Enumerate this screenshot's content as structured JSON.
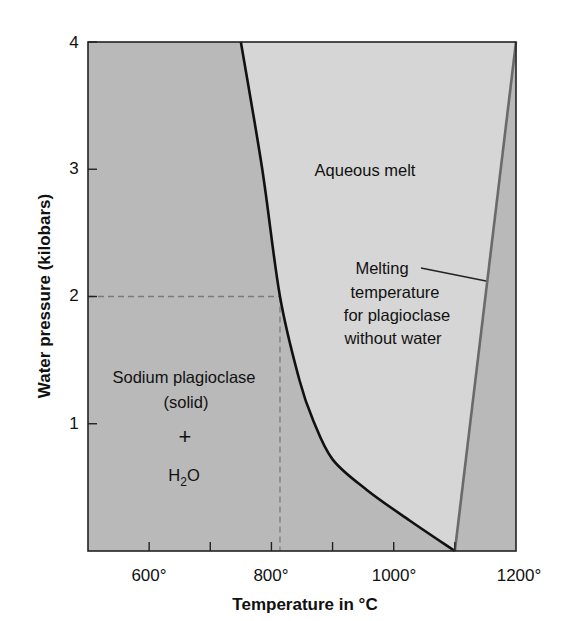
{
  "chart_data": {
    "type": "line",
    "title": "",
    "xlabel": "Temperature in °C",
    "ylabel": "Water pressure (kilobars)",
    "xlim": [
      500,
      1200
    ],
    "ylim": [
      0,
      4
    ],
    "x_ticks": [
      600,
      700,
      800,
      900,
      1000,
      1100
    ],
    "x_tick_labels": [
      {
        "value": 600,
        "label": "600°"
      },
      {
        "value": 800,
        "label": "800°"
      },
      {
        "value": 1000,
        "label": "1000°"
      },
      {
        "value": 1200,
        "label": "1200°"
      }
    ],
    "y_ticks": [
      1,
      2,
      3,
      4
    ],
    "y_tick_labels": [
      {
        "value": 1,
        "label": "1"
      },
      {
        "value": 2,
        "label": "2"
      },
      {
        "value": 3,
        "label": "3"
      },
      {
        "value": 4,
        "label": "4"
      }
    ],
    "grid": false,
    "series": [
      {
        "name": "Wet melting curve (solidus with water)",
        "color": "#111111",
        "points": [
          {
            "x": 750,
            "y": 4.0
          },
          {
            "x": 785,
            "y": 3.0
          },
          {
            "x": 814,
            "y": 2.0
          },
          {
            "x": 846,
            "y": 1.34
          },
          {
            "x": 868,
            "y": 1.03
          },
          {
            "x": 900,
            "y": 0.72
          },
          {
            "x": 956,
            "y": 0.48
          },
          {
            "x": 1026,
            "y": 0.24
          },
          {
            "x": 1100,
            "y": 0.0
          }
        ]
      },
      {
        "name": "Melting temperature for plagioclase without water",
        "color": "#6a6a6a",
        "points": [
          {
            "x": 1100,
            "y": 0.0
          },
          {
            "x": 1200,
            "y": 4.0
          }
        ]
      }
    ],
    "reference_lines": [
      {
        "type": "dashed",
        "from": {
          "x": 500,
          "y": 2.0
        },
        "to": {
          "x": 814,
          "y": 2.0
        }
      },
      {
        "type": "dashed",
        "from": {
          "x": 814,
          "y": 2.0
        },
        "to": {
          "x": 814,
          "y": 0.0
        }
      }
    ],
    "regions": [
      {
        "name": "Sodium plagioclase (solid) + H2O",
        "color": "#b9b9b9"
      },
      {
        "name": "Aqueous melt",
        "color": "#d6d6d6"
      }
    ],
    "annotations": [
      {
        "id": "aqueous",
        "lines": [
          "Aqueous melt"
        ],
        "x": 880,
        "y": 3.0
      },
      {
        "id": "solid",
        "lines": [
          "Sodium plagioclase",
          "(solid)",
          "+",
          "H2O"
        ],
        "x": 660,
        "y": 1.35
      },
      {
        "id": "melting",
        "lines": [
          "Melting",
          "temperature",
          "for plagioclase",
          "without water"
        ],
        "x": 1045,
        "y": 2.1
      }
    ]
  },
  "labels": {
    "xlabel": "Temperature in °C",
    "ylabel": "Water pressure (kilobars)",
    "aqueous_melt": "Aqueous melt",
    "solid_line1": "Sodium plagioclase",
    "solid_line2": "(solid)",
    "plus": "+",
    "h2o_h": "H",
    "h2o_sub": "2",
    "h2o_o": "O",
    "melt_line1": "Melting",
    "melt_line2": "temperature",
    "melt_line3": "for plagioclase",
    "melt_line4": "without water",
    "x600": "600°",
    "x800": "800°",
    "x1000": "1000°",
    "x1200": "1200°",
    "y1": "1",
    "y2": "2",
    "y3": "3",
    "y4": "4"
  },
  "colors": {
    "solid_region": "#b9b9b9",
    "melt_region": "#d6d6d6",
    "curve": "#111111",
    "dry_line": "#6a6a6a",
    "dashed": "#7a7a7a"
  }
}
